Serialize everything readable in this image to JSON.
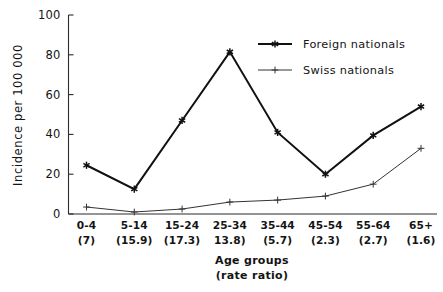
{
  "chart_data": {
    "type": "line",
    "title": "",
    "xlabel": "Age groups\n(rate ratio)",
    "xlabel_line1": "Age groups",
    "xlabel_line2": "(rate ratio)",
    "ylabel": "Incidence per 100 000",
    "ylim": [
      0,
      100
    ],
    "yticks": [
      0,
      20,
      40,
      60,
      80,
      100
    ],
    "ytick_labels": [
      "0",
      "20",
      "40",
      "60",
      "80",
      "100"
    ],
    "grid": false,
    "legend_position": "upper right",
    "categories": [
      "0-4",
      "5-14",
      "15-24",
      "25-34",
      "35-44",
      "45-54",
      "55-64",
      "65+"
    ],
    "rate_ratios": [
      "(7)",
      "(15.9)",
      "(17.3)",
      "13.8)",
      "(5.7)",
      "(2.3)",
      "(2.7)",
      "(1.6)"
    ],
    "series": [
      {
        "name": "Foreign nationals",
        "marker": "star",
        "values": [
          24.5,
          12.5,
          47,
          81.5,
          41,
          20,
          39.5,
          54
        ]
      },
      {
        "name": "Swiss nationals",
        "marker": "plus",
        "values": [
          3.5,
          1,
          2.5,
          6,
          7,
          9,
          15,
          33
        ]
      }
    ]
  },
  "legend": {
    "items": [
      {
        "label": "Foreign nationals",
        "marker": "star-marker"
      },
      {
        "label": "Swiss nationals",
        "marker": "plus-marker"
      }
    ]
  },
  "colors": {
    "foreign": "#111111",
    "swiss": "#333333",
    "axis": "#2b2b2b",
    "background": "#ffffff"
  }
}
